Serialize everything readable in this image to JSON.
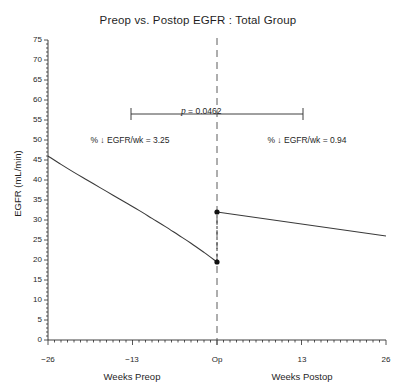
{
  "chart_data": {
    "type": "line",
    "title": "Preop vs. Postop EGFR : Total Group",
    "xlabel_left": "Weeks Preop",
    "xlabel_right": "Weeks Postop",
    "ylabel": "EGFR (mL/min)",
    "xlim": [
      -26,
      26
    ],
    "ylim": [
      0,
      75
    ],
    "ytick_labels": [
      "75",
      "70",
      "65",
      "60",
      "55",
      "50",
      "45",
      "40",
      "35",
      "30",
      "25",
      "20",
      "15",
      "10",
      "5",
      "0"
    ],
    "ytick_values": [
      75,
      70,
      65,
      60,
      55,
      50,
      45,
      40,
      35,
      30,
      25,
      20,
      15,
      10,
      5,
      0
    ],
    "ytick_minor_step": 1,
    "xtick_labels": [
      "−26",
      "−13",
      "Op",
      "13",
      "26"
    ],
    "xtick_values": [
      -26,
      -13,
      0,
      13,
      26
    ],
    "xtick_minor_step": 1,
    "grid": false,
    "legend": "none",
    "series": [
      {
        "name": "Preop EGFR",
        "style": "solid-curve",
        "x": [
          -26,
          -24,
          -22,
          -20,
          -18,
          -16,
          -14,
          -12,
          -10,
          -8,
          -6,
          -4,
          -2,
          0
        ],
        "y": [
          46.0,
          43.9,
          41.9,
          40.0,
          38.1,
          36.2,
          34.3,
          32.4,
          30.4,
          28.4,
          26.3,
          24.2,
          21.9,
          19.5
        ]
      },
      {
        "name": "Postop EGFR",
        "style": "solid-line",
        "x": [
          0,
          26
        ],
        "y": [
          32.0,
          26.0
        ]
      },
      {
        "name": "Operative drop connector",
        "style": "dashed-connector",
        "x": [
          0,
          0
        ],
        "y": [
          19.5,
          32.0
        ]
      }
    ],
    "markers": [
      {
        "name": "preop-endpoint",
        "x": 0,
        "y": 19.5
      },
      {
        "name": "postop-startpoint",
        "x": 0,
        "y": 32.0
      }
    ],
    "vline": {
      "name": "op-reference-line",
      "x": 0,
      "style": "dashed"
    },
    "annotations": [
      {
        "name": "p-value",
        "text": "p = 0.0462",
        "italic_prefix": "p",
        "rest": " = 0.0462",
        "x": 0,
        "y": 55,
        "bracket_from": -13.2,
        "bracket_to": 12.0
      },
      {
        "name": "preop-slope",
        "text": "% ↓ EGFR/wk = 3.25",
        "x": -13,
        "y": 48.5
      },
      {
        "name": "postop-slope",
        "text": "% ↓ EGFR/wk = 0.94",
        "x": 12,
        "y": 48.5
      }
    ]
  },
  "colors": {
    "axis": "#2b2b2b",
    "line": "#3a3a3a",
    "marker": "#111111",
    "text": "#1f1f1f",
    "background": "#ffffff"
  }
}
